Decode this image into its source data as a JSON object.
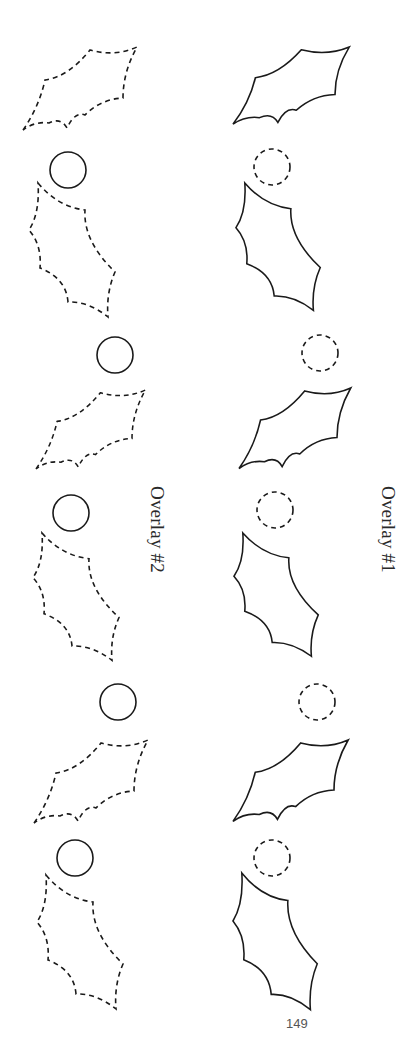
{
  "page": {
    "number": "149",
    "background": "#ffffff",
    "ink_color": "#1a1a1a"
  },
  "overlays": [
    {
      "label": "Overlay #2",
      "column": "left",
      "leaf_style": "dashed",
      "berry_style": "solid",
      "items": [
        {
          "type": "leaf",
          "orientation": "diagonal"
        },
        {
          "type": "berry"
        },
        {
          "type": "leaf",
          "orientation": "vertical"
        },
        {
          "type": "berry"
        },
        {
          "type": "leaf",
          "orientation": "diagonal"
        },
        {
          "type": "berry"
        },
        {
          "type": "leaf",
          "orientation": "vertical"
        },
        {
          "type": "berry"
        },
        {
          "type": "leaf",
          "orientation": "diagonal"
        },
        {
          "type": "berry"
        },
        {
          "type": "leaf",
          "orientation": "vertical"
        }
      ]
    },
    {
      "label": "Overlay #1",
      "column": "right",
      "leaf_style": "solid",
      "berry_style": "dashed",
      "items": [
        {
          "type": "leaf",
          "orientation": "diagonal"
        },
        {
          "type": "berry"
        },
        {
          "type": "leaf",
          "orientation": "vertical"
        },
        {
          "type": "berry"
        },
        {
          "type": "leaf",
          "orientation": "diagonal"
        },
        {
          "type": "berry"
        },
        {
          "type": "leaf",
          "orientation": "vertical"
        },
        {
          "type": "berry"
        },
        {
          "type": "leaf",
          "orientation": "diagonal"
        },
        {
          "type": "berry"
        },
        {
          "type": "leaf",
          "orientation": "vertical"
        }
      ]
    }
  ]
}
